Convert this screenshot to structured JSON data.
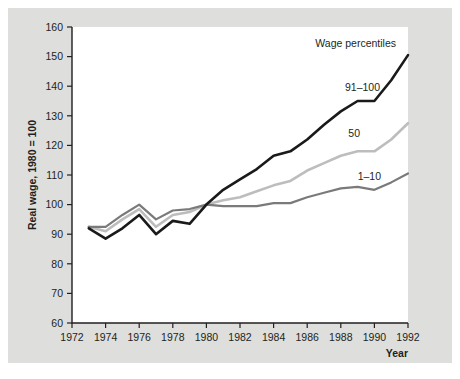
{
  "figure": {
    "background_color": "#dededc",
    "plot_background_color": "#ffffff",
    "axis_color": "#231f20"
  },
  "labels": {
    "y_axis_title": "Real wage, 1980 = 100",
    "x_axis_title": "Year",
    "legend_title": "Wage percentiles",
    "series_top_label": "91–100",
    "series_mid_label": "50",
    "series_low_label": "1–10"
  },
  "chart_data": {
    "type": "line",
    "title": "",
    "subtitle": "",
    "xlabel": "Year",
    "ylabel": "Real wage, 1980 = 100",
    "xlim": [
      1972,
      1992
    ],
    "ylim": [
      60,
      160
    ],
    "grid": false,
    "legend_position": "inline-annotations",
    "legend_title": "Wage percentiles",
    "x_ticks": [
      1972,
      1974,
      1976,
      1978,
      1980,
      1982,
      1984,
      1986,
      1988,
      1990,
      1992
    ],
    "y_ticks": [
      60,
      70,
      80,
      90,
      100,
      110,
      120,
      130,
      140,
      150,
      160
    ],
    "x": [
      1973,
      1974,
      1975,
      1976,
      1977,
      1978,
      1979,
      1980,
      1981,
      1982,
      1983,
      1984,
      1985,
      1986,
      1987,
      1988,
      1989,
      1990,
      1991,
      1992
    ],
    "series": [
      {
        "name": "91–100",
        "color": "#1a1a1a",
        "width": 2.6,
        "values": [
          92.0,
          88.5,
          92.0,
          96.5,
          90.0,
          94.5,
          93.5,
          100.0,
          105.0,
          108.5,
          112.0,
          116.5,
          118.0,
          122.0,
          127.0,
          131.5,
          135.0,
          135.0,
          142.0,
          150.5
        ]
      },
      {
        "name": "50",
        "color": "#bdbdbd",
        "width": 2.6,
        "values": [
          92.5,
          91.0,
          95.0,
          98.5,
          92.5,
          96.5,
          97.5,
          100.0,
          101.5,
          102.5,
          104.5,
          106.5,
          108.0,
          111.5,
          114.0,
          116.5,
          118.0,
          118.0,
          122.0,
          127.5
        ]
      },
      {
        "name": "1–10",
        "color": "#7a7a7a",
        "width": 2.2,
        "values": [
          92.5,
          92.5,
          96.5,
          100.0,
          95.0,
          98.0,
          98.5,
          100.0,
          99.5,
          99.5,
          99.5,
          100.5,
          100.5,
          102.5,
          104.0,
          105.5,
          106.0,
          105.0,
          107.5,
          110.5
        ]
      }
    ]
  }
}
